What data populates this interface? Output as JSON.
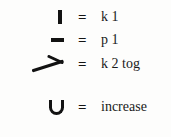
{
  "legend": {
    "title": "knitting-symbol-key",
    "background_color": "#fdfdfc",
    "text_color": "#1a1a1a",
    "equals_sign": "=",
    "rows": [
      {
        "symbol_name": "vertical-bar-symbol",
        "equals": "=",
        "label": "k 1"
      },
      {
        "symbol_name": "horizontal-dash-symbol",
        "equals": "=",
        "label": "p 1"
      },
      {
        "symbol_name": "chevron-arrow-symbol",
        "equals": "=",
        "label": "k 2 tog"
      },
      {
        "symbol_name": "u-shape-symbol",
        "equals": "=",
        "label": "increase"
      }
    ]
  }
}
